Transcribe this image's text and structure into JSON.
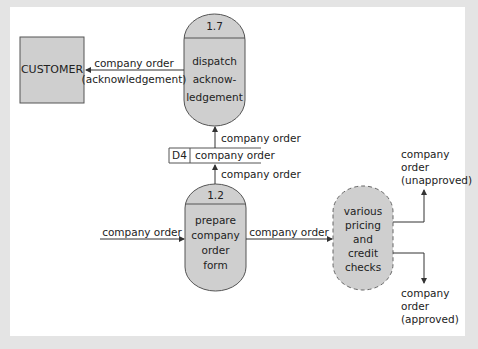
{
  "diagram": {
    "type": "data-flow-diagram",
    "colors": {
      "background": "#e4e4e4",
      "panel": "#ffffff",
      "shape_fill": "#cfcfcf",
      "stroke": "#555555",
      "text": "#222222"
    },
    "external_entity": {
      "label": "CUSTOMER"
    },
    "processes": [
      {
        "id": "1.7",
        "lines": [
          "dispatch",
          "acknow-",
          "ledgement"
        ]
      },
      {
        "id": "1.2",
        "lines": [
          "prepare",
          "company",
          "order",
          "form"
        ]
      },
      {
        "id": "",
        "lines": [
          "various",
          "pricing",
          "and",
          "credit",
          "checks"
        ],
        "dashed": true
      }
    ],
    "data_store": {
      "id": "D4",
      "name": "company order"
    },
    "flows": {
      "to_customer": [
        "company order",
        "(acknowledgement)"
      ],
      "store_to_1_7": "company order",
      "1_2_to_store": "company order",
      "input_to_1_2": "company order",
      "1_2_to_checks": "company order",
      "unapproved": [
        "company",
        "order",
        "(unapproved)"
      ],
      "approved": [
        "company",
        "order",
        "(approved)"
      ]
    }
  }
}
